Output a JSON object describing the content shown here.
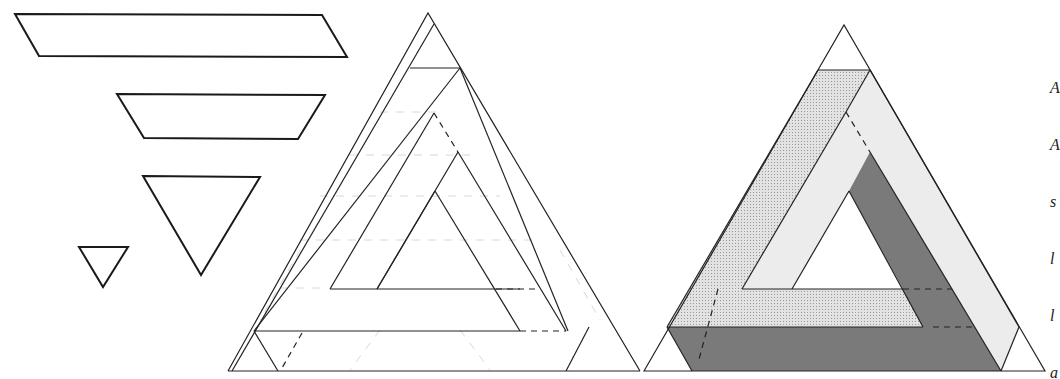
{
  "figure": {
    "pieces": [
      {
        "name": "long-parallelogram"
      },
      {
        "name": "trapezoid"
      },
      {
        "name": "large-inverted-triangle"
      },
      {
        "name": "small-inverted-triangle"
      }
    ],
    "panels": [
      {
        "name": "line-construction",
        "style": "outline"
      },
      {
        "name": "shaded-result",
        "style": "shaded"
      }
    ],
    "colors": {
      "dark_face": "#7a7a7a",
      "light_face": "#ececec",
      "stipple_face": "#d4d4d4",
      "line": "#222222"
    }
  },
  "caption": {
    "lines": [
      "A",
      "A",
      "s",
      "l",
      "l",
      "a"
    ]
  }
}
